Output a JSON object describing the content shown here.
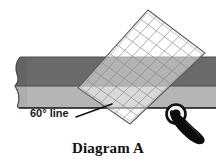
{
  "figure": {
    "caption": "Diagram A",
    "angle_label": "60° line",
    "background_color": "#ffffff"
  },
  "fabric_band": {
    "name": "fabric-strip",
    "top_strip_color": "#6a6a6a",
    "bottom_strip_color": "#b5b5b5",
    "edge_outline_color": "#111111",
    "left_edge_style": "torn-wavy",
    "top_y": 57,
    "mid_y": 85,
    "bottom_y": 108,
    "left_x": 14,
    "right_x": 216
  },
  "ruler": {
    "name": "quilting-ruler",
    "type": "transparent-grid-square",
    "grid_line_color": "#8f8f8f",
    "outline_color": "#6b6b6b",
    "rotation_degrees": 30,
    "columns": 7,
    "rows": 9,
    "corner_on_line_x": 112,
    "corner_on_line_y": 104
  },
  "rotary_cutter": {
    "name": "rotary-cutter",
    "blade_color": "#ffffff",
    "blade_ring_color": "#111111",
    "hub_color": "#111111",
    "handle_color": "#0d0d0d",
    "blade_center_x": 176,
    "blade_center_y": 114,
    "blade_radius": 9
  },
  "leader_line": {
    "name": "leader-line-60-degree",
    "color": "#111111",
    "from_x": 76,
    "from_y": 117,
    "to_x": 112,
    "to_y": 104
  },
  "labels": {
    "angle_label_x": 30,
    "angle_label_y": 117,
    "caption_x": 108,
    "caption_y": 153
  }
}
